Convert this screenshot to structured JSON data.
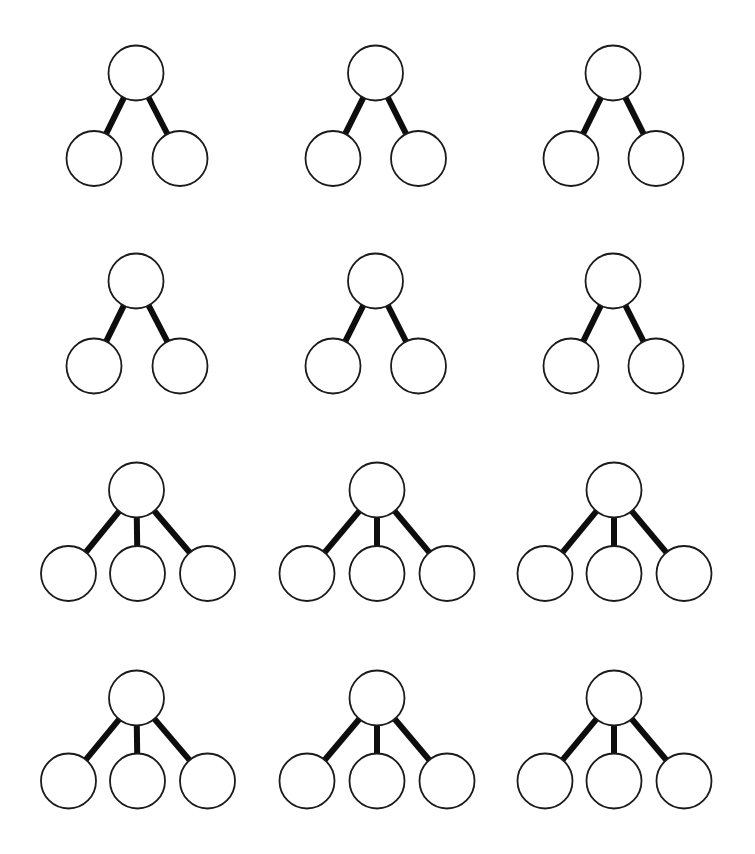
{
  "worksheet": {
    "type": "number-bond-worksheet",
    "colors": {
      "background": "#ffffff",
      "circle_stroke": "#1a1a1a",
      "circle_fill": "#ffffff",
      "connector": "#0d0d0d"
    },
    "node_radius": 27.5,
    "columns_x": [
      136,
      375,
      613
    ],
    "rows": [
      {
        "row": 1,
        "children": 2,
        "top_y": 73,
        "bottom_y": 158.5,
        "diagrams": [
          {
            "top": [
              136,
              73
            ],
            "kids": [
              [
                94,
                158.5
              ],
              [
                180,
                158.5
              ]
            ],
            "values": [
              "",
              "",
              ""
            ]
          },
          {
            "top": [
              375.5,
              73
            ],
            "kids": [
              [
                333,
                158.5
              ],
              [
                418.5,
                158.5
              ]
            ],
            "values": [
              "",
              "",
              ""
            ]
          },
          {
            "top": [
              613,
              73
            ],
            "kids": [
              [
                571,
                158.5
              ],
              [
                656,
                158.5
              ]
            ],
            "values": [
              "",
              "",
              ""
            ]
          }
        ]
      },
      {
        "row": 2,
        "children": 2,
        "top_y": 281,
        "bottom_y": 366,
        "diagrams": [
          {
            "top": [
              136,
              281
            ],
            "kids": [
              [
                94,
                366
              ],
              [
                180,
                366
              ]
            ],
            "values": [
              "",
              "",
              ""
            ]
          },
          {
            "top": [
              375.5,
              281
            ],
            "kids": [
              [
                333,
                366
              ],
              [
                418.5,
                366
              ]
            ],
            "values": [
              "",
              "",
              ""
            ]
          },
          {
            "top": [
              613,
              281
            ],
            "kids": [
              [
                571,
                366
              ],
              [
                656,
                366
              ]
            ],
            "values": [
              "",
              "",
              ""
            ]
          }
        ]
      },
      {
        "row": 3,
        "children": 3,
        "top_y": 490,
        "bottom_y": 573.5,
        "diagrams": [
          {
            "top": [
              136.5,
              490
            ],
            "kids": [
              [
                68.5,
                573.5
              ],
              [
                137.5,
                573.5
              ],
              [
                207.5,
                573.5
              ]
            ],
            "values": [
              "",
              "",
              "",
              ""
            ]
          },
          {
            "top": [
              377,
              490
            ],
            "kids": [
              [
                307,
                573.5
              ],
              [
                377,
                573.5
              ],
              [
                447,
                573.5
              ]
            ],
            "values": [
              "",
              "",
              "",
              ""
            ]
          },
          {
            "top": [
              614,
              490
            ],
            "kids": [
              [
                545,
                573.5
              ],
              [
                614,
                573.5
              ],
              [
                684,
                573.5
              ]
            ],
            "values": [
              "",
              "",
              "",
              ""
            ]
          }
        ]
      },
      {
        "row": 4,
        "children": 3,
        "top_y": 698,
        "bottom_y": 781,
        "diagrams": [
          {
            "top": [
              136.5,
              698
            ],
            "kids": [
              [
                68.5,
                781
              ],
              [
                137.5,
                781
              ],
              [
                207.5,
                781
              ]
            ],
            "values": [
              "",
              "",
              "",
              ""
            ]
          },
          {
            "top": [
              377,
              698
            ],
            "kids": [
              [
                307,
                781
              ],
              [
                377,
                781
              ],
              [
                447,
                781
              ]
            ],
            "values": [
              "",
              "",
              "",
              ""
            ]
          },
          {
            "top": [
              614,
              698
            ],
            "kids": [
              [
                545,
                781
              ],
              [
                614,
                781
              ],
              [
                684,
                781
              ]
            ],
            "values": [
              "",
              "",
              "",
              ""
            ]
          }
        ]
      }
    ]
  }
}
